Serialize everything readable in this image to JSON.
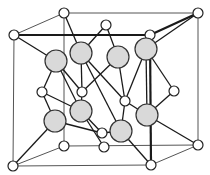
{
  "figure": {
    "atom_types": [
      {
        "name": "lattice-site atom",
        "color": "#ffffff"
      },
      {
        "name": "interior tetrahedral atom",
        "color": "#d9d9d9"
      }
    ],
    "counts": {
      "white_atoms_visible": 16,
      "gray_atoms_visible": 8
    }
  }
}
